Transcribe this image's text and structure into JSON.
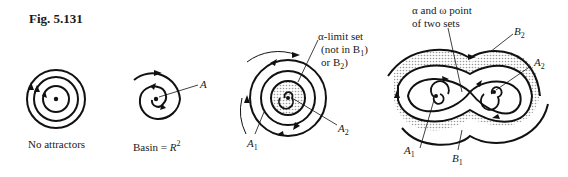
{
  "figure": {
    "title": "Fig. 5.131",
    "panels": [
      {
        "id": "no-attractors",
        "caption": "No attractors"
      },
      {
        "id": "basin",
        "caption_prefix": "Basin = ",
        "caption_var": "R",
        "caption_sup": "2",
        "point_label": "A"
      },
      {
        "id": "alpha-limit",
        "annotation_lines": [
          "α-limit set",
          "(not in B",
          "or B"
        ],
        "labels": {
          "A1": "A",
          "A2": "A"
        },
        "sub1": "1",
        "sub2": "2"
      },
      {
        "id": "two-basins",
        "annotation_lines": [
          "α and ω point",
          "of two sets"
        ],
        "labels": {
          "B1": "B",
          "B2": "B",
          "A1": "A",
          "A2": "A"
        },
        "sub1": "1",
        "sub2": "2"
      }
    ]
  }
}
